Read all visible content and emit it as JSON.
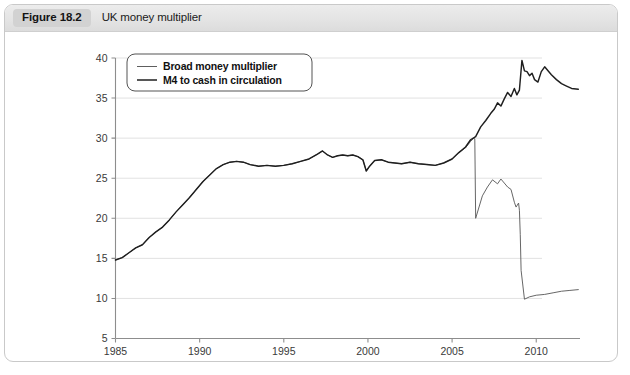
{
  "figure": {
    "number_label": "Figure 18.2",
    "title": "UK money multiplier"
  },
  "legend": {
    "position": "top-left-inside",
    "entries": [
      {
        "label": "Broad money multiplier",
        "color": "#5e5e5e",
        "style": "thin"
      },
      {
        "label": "M4 to cash in circulation",
        "color": "#1f1f1f",
        "style": "thick"
      }
    ]
  },
  "axes": {
    "y_ticks": [
      "40",
      "35",
      "30",
      "25",
      "20",
      "15",
      "10",
      "5"
    ],
    "x_ticks": [
      "1985",
      "1990",
      "1995",
      "2000",
      "2005",
      "2010"
    ]
  },
  "chart_data": {
    "type": "line",
    "title": "UK money multiplier",
    "xlabel": "",
    "ylabel": "",
    "xlim": [
      1985,
      2012.6
    ],
    "ylim": [
      5,
      40
    ],
    "y_ticks": [
      5,
      10,
      15,
      20,
      25,
      30,
      35,
      40
    ],
    "x_ticks": [
      1985,
      1990,
      1995,
      2000,
      2005,
      2010
    ],
    "grid": "horizontal",
    "legend_position": "upper left inside plot",
    "annotations": [
      "Broad money multiplier breaks sharply downward from about 30 to about 20 in mid-2006 (series redefinition / structural break)",
      "Broad money multiplier collapses from about 21 to about 10 in early 2009",
      "M4 to cash in circulation rises steadily, peaking near 39.7 around 2009-2010, then easing to about 36"
    ],
    "series": [
      {
        "name": "Broad money multiplier",
        "color": "#5e5e5e",
        "x": [
          1985.0,
          1985.4,
          1985.8,
          1986.2,
          1986.6,
          1987.0,
          1987.4,
          1987.8,
          1988.2,
          1988.6,
          1989.0,
          1989.4,
          1989.8,
          1990.2,
          1990.6,
          1991.0,
          1991.4,
          1991.8,
          1992.2,
          1992.6,
          1993.0,
          1993.5,
          1994.0,
          1994.5,
          1995.0,
          1995.5,
          1996.0,
          1996.5,
          1997.0,
          1997.3,
          1997.6,
          1997.9,
          1998.2,
          1998.5,
          1998.8,
          1999.1,
          1999.4,
          1999.7,
          1999.9,
          2000.1,
          2000.4,
          2000.8,
          2001.2,
          2001.6,
          2002.0,
          2002.5,
          2003.0,
          2003.5,
          2004.0,
          2004.5,
          2005.0,
          2005.4,
          2005.8,
          2006.1,
          2006.3,
          2006.35,
          2006.4,
          2006.8,
          2007.1,
          2007.4,
          2007.7,
          2007.9,
          2008.1,
          2008.3,
          2008.5,
          2008.7,
          2008.8,
          2008.95,
          2009.0,
          2009.05,
          2009.1,
          2009.3,
          2009.6,
          2010.0,
          2010.5,
          2011.0,
          2011.5,
          2012.0,
          2012.5
        ],
        "y": [
          14.8,
          15.1,
          15.7,
          16.3,
          16.7,
          17.6,
          18.3,
          18.9,
          19.8,
          20.8,
          21.7,
          22.6,
          23.6,
          24.6,
          25.4,
          26.2,
          26.7,
          27.0,
          27.1,
          27.0,
          26.7,
          26.5,
          26.6,
          26.5,
          26.6,
          26.8,
          27.1,
          27.4,
          28.0,
          28.4,
          27.9,
          27.6,
          27.8,
          27.9,
          27.8,
          27.9,
          27.7,
          27.3,
          25.9,
          26.5,
          27.2,
          27.3,
          27.0,
          26.9,
          26.8,
          27.0,
          26.8,
          26.7,
          26.6,
          26.9,
          27.4,
          28.2,
          28.8,
          29.6,
          30.0,
          29.9,
          20.0,
          22.8,
          23.9,
          24.8,
          24.3,
          24.9,
          24.4,
          23.9,
          23.6,
          22.0,
          21.4,
          21.9,
          21.0,
          18.0,
          13.5,
          9.9,
          10.2,
          10.4,
          10.5,
          10.7,
          10.9,
          11.0,
          11.1
        ]
      },
      {
        "name": "M4 to cash in circulation",
        "color": "#1f1f1f",
        "x": [
          1985.0,
          1985.4,
          1985.8,
          1986.2,
          1986.6,
          1987.0,
          1987.4,
          1987.8,
          1988.2,
          1988.6,
          1989.0,
          1989.4,
          1989.8,
          1990.2,
          1990.6,
          1991.0,
          1991.4,
          1991.8,
          1992.2,
          1992.6,
          1993.0,
          1993.5,
          1994.0,
          1994.5,
          1995.0,
          1995.5,
          1996.0,
          1996.5,
          1997.0,
          1997.3,
          1997.6,
          1997.9,
          1998.2,
          1998.5,
          1998.8,
          1999.1,
          1999.4,
          1999.7,
          1999.9,
          2000.1,
          2000.4,
          2000.8,
          2001.2,
          2001.6,
          2002.0,
          2002.5,
          2003.0,
          2003.5,
          2004.0,
          2004.5,
          2005.0,
          2005.4,
          2005.8,
          2006.1,
          2006.4,
          2006.7,
          2007.0,
          2007.3,
          2007.5,
          2007.7,
          2007.9,
          2008.1,
          2008.3,
          2008.5,
          2008.7,
          2008.85,
          2009.0,
          2009.15,
          2009.3,
          2009.45,
          2009.6,
          2009.75,
          2009.9,
          2010.1,
          2010.3,
          2010.5,
          2010.7,
          2010.9,
          2011.2,
          2011.5,
          2011.8,
          2012.1,
          2012.5
        ],
        "y": [
          14.8,
          15.1,
          15.7,
          16.3,
          16.7,
          17.6,
          18.3,
          18.9,
          19.8,
          20.8,
          21.7,
          22.6,
          23.6,
          24.6,
          25.4,
          26.2,
          26.7,
          27.0,
          27.1,
          27.0,
          26.7,
          26.5,
          26.6,
          26.5,
          26.6,
          26.8,
          27.1,
          27.4,
          28.0,
          28.4,
          27.9,
          27.6,
          27.8,
          27.9,
          27.8,
          27.9,
          27.7,
          27.3,
          25.9,
          26.5,
          27.2,
          27.3,
          27.0,
          26.9,
          26.8,
          27.0,
          26.8,
          26.7,
          26.6,
          26.9,
          27.4,
          28.2,
          28.9,
          29.8,
          30.2,
          31.4,
          32.2,
          33.1,
          33.6,
          34.4,
          34.0,
          34.9,
          35.7,
          35.2,
          36.2,
          35.4,
          36.0,
          39.7,
          38.4,
          38.3,
          37.8,
          38.1,
          37.3,
          37.0,
          38.3,
          38.9,
          38.4,
          37.9,
          37.3,
          36.8,
          36.5,
          36.2,
          36.1
        ]
      }
    ]
  }
}
